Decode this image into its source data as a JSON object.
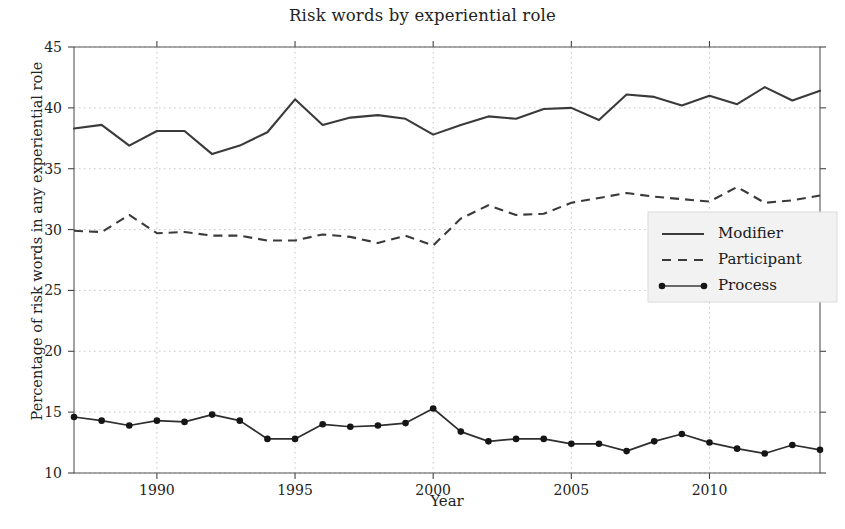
{
  "chart_data": {
    "type": "line",
    "title": "Risk words by experiential role",
    "xlabel": "Year",
    "ylabel": "Percentage of risk words in any experiential role",
    "xlim": [
      1986.9,
      1986.9
    ],
    "ylim": [
      10,
      45
    ],
    "yticks": [
      10,
      15,
      20,
      25,
      30,
      35,
      40,
      45
    ],
    "xticks": [
      1990,
      1995,
      2000,
      2005,
      2010
    ],
    "grid": true,
    "legend_position": "center-right",
    "x": [
      1987,
      1988,
      1989,
      1990,
      1991,
      1992,
      1993,
      1994,
      1995,
      1996,
      1997,
      1998,
      1999,
      2000,
      2001,
      2002,
      2003,
      2004,
      2005,
      2006,
      2007,
      2008,
      2009,
      2010,
      2011,
      2012,
      2013,
      2014
    ],
    "series": [
      {
        "name": "Modifier",
        "style": "solid",
        "values": [
          38.3,
          38.6,
          36.9,
          38.1,
          38.1,
          36.2,
          36.9,
          38.0,
          40.7,
          38.6,
          39.2,
          39.4,
          39.1,
          37.8,
          38.6,
          39.3,
          39.1,
          39.9,
          40.0,
          39.0,
          41.1,
          40.9,
          40.2,
          41.0,
          40.3,
          41.7,
          40.6,
          41.4
        ]
      },
      {
        "name": "Participant",
        "style": "dashed",
        "values": [
          29.9,
          29.8,
          31.2,
          29.7,
          29.8,
          29.5,
          29.5,
          29.1,
          29.1,
          29.6,
          29.4,
          28.9,
          29.5,
          28.7,
          30.9,
          32.0,
          31.2,
          31.3,
          32.2,
          32.6,
          33.0,
          32.7,
          32.5,
          32.3,
          33.5,
          32.2,
          32.4,
          32.8
        ]
      },
      {
        "name": "Process",
        "style": "solid-markers",
        "values": [
          14.6,
          14.3,
          13.9,
          14.3,
          14.2,
          14.8,
          14.3,
          12.8,
          12.8,
          14.0,
          13.8,
          13.9,
          14.1,
          15.3,
          13.4,
          12.6,
          12.8,
          12.8,
          12.4,
          12.4,
          11.8,
          12.6,
          13.2,
          12.5,
          12.0,
          11.6,
          12.3,
          11.9
        ]
      }
    ],
    "colors": {
      "line": "#3a3a3a",
      "marker": "#151515",
      "grid": "#c8c8c8",
      "background": "#ffffff",
      "legend_background": "#f2f2f2"
    }
  },
  "legend": {
    "entries": [
      {
        "label": "Modifier",
        "style": "solid"
      },
      {
        "label": "Participant",
        "style": "dashed"
      },
      {
        "label": "Process",
        "style": "solid-markers"
      }
    ]
  }
}
